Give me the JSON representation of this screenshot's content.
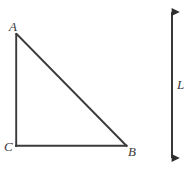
{
  "figure": {
    "background_color": "#ffffff",
    "stroke_color": "#3a3a3a",
    "width": 188,
    "height": 169
  },
  "triangle": {
    "name": "triangle-ABC",
    "type": "right-triangle",
    "right_angle_at": "C",
    "vertices": [
      {
        "id": "A",
        "label": "A",
        "x": 16,
        "y": 34
      },
      {
        "id": "B",
        "label": "B",
        "x": 126,
        "y": 146
      },
      {
        "id": "C",
        "label": "C",
        "x": 16,
        "y": 146
      }
    ],
    "edges": [
      {
        "id": "AC",
        "from": "A",
        "to": "C",
        "orientation": "vertical"
      },
      {
        "id": "CB",
        "from": "C",
        "to": "B",
        "orientation": "horizontal"
      },
      {
        "id": "AB",
        "from": "A",
        "to": "B",
        "orientation": "diagonal"
      }
    ]
  },
  "measure_arrow": {
    "name": "vertical-double-arrow",
    "label": "L",
    "x": 172,
    "y_top": 4,
    "y_bottom": 166,
    "arrowheads": "both"
  },
  "labels": {
    "A": "A",
    "B": "B",
    "C": "C",
    "L": "L"
  }
}
